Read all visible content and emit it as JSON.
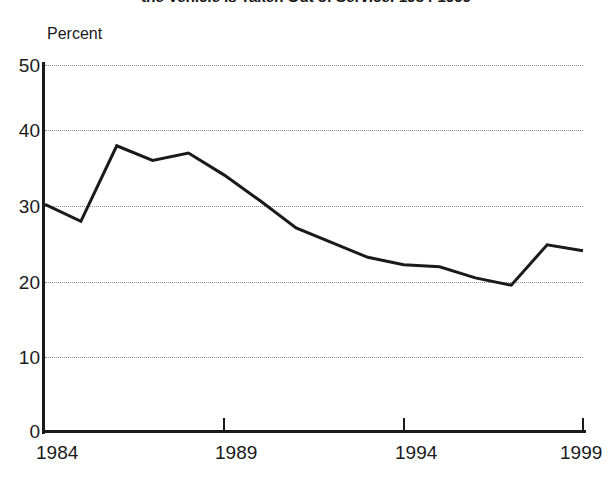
{
  "chart_data": {
    "type": "line",
    "title": "the Vehicle is Taken Out of Service: 1984-1999",
    "subtitle": "",
    "xlabel": "",
    "ylabel": "Percent",
    "ylim": [
      0,
      50
    ],
    "xlim": [
      1984,
      1999
    ],
    "grid": true,
    "legend": false,
    "y_ticks": [
      50,
      40,
      30,
      20,
      10,
      0
    ],
    "x_ticks": [
      1984,
      1989,
      1994,
      1999
    ],
    "x_tick_labels": [
      "1984",
      "1989",
      "1994",
      "1999"
    ],
    "y_tick_labels": [
      "50",
      "40",
      "30",
      "20",
      "10",
      "0"
    ],
    "line_color": "#1a1a1a",
    "x": [
      1984,
      1985,
      1986,
      1987,
      1988,
      1989,
      1990,
      1991,
      1992,
      1993,
      1994,
      1995,
      1996,
      1997,
      1998,
      1999
    ],
    "series": [
      {
        "name": "Percent",
        "values": [
          31.0,
          28.7,
          39.0,
          37.0,
          38.0,
          35.0,
          31.5,
          27.8,
          25.8,
          23.8,
          22.8,
          22.5,
          21.0,
          20.0,
          25.5,
          24.7
        ]
      }
    ]
  },
  "axis": {
    "y_unit_label": "Percent"
  }
}
